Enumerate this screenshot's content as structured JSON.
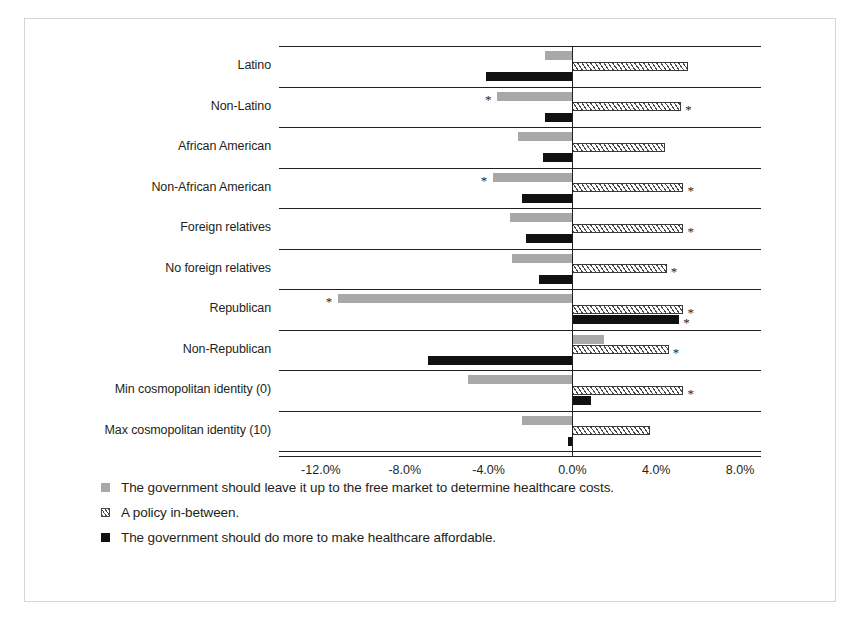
{
  "chart_data": {
    "type": "bar",
    "orientation": "horizontal",
    "title": "",
    "xlabel": "",
    "ylabel": "",
    "grid": true,
    "legend_position": "bottom-left",
    "xlim": [
      -14.0,
      9.0
    ],
    "xticks": [
      "-12.0%",
      "-8.0%",
      "-4.0%",
      "0.0%",
      "4.0%",
      "8.0%"
    ],
    "xtick_values": [
      -12.0,
      -8.0,
      -4.0,
      0.0,
      4.0,
      8.0
    ],
    "categories": [
      "Latino",
      "Non-Latino",
      "African American",
      "Non-African American",
      "Foreign relatives",
      "No foreign relatives",
      "Republican",
      "Non-Republican",
      "Min cosmopolitan identity (0)",
      "Max cosmopolitan identity (10)"
    ],
    "series": [
      {
        "name": "The government should leave it up to the free market to determine healthcare costs.",
        "key": "free_market",
        "color": "#a8a8a8",
        "pattern": "solid",
        "values": [
          -1.3,
          -3.6,
          -2.6,
          -3.8,
          -3.0,
          -2.9,
          -11.2,
          1.5,
          -5.0,
          -2.4
        ],
        "significant": [
          false,
          true,
          false,
          true,
          false,
          false,
          true,
          false,
          false,
          false
        ]
      },
      {
        "name": "A policy in-between.",
        "key": "in_between",
        "color": "#ffffff",
        "pattern": "hatched",
        "values": [
          5.5,
          5.2,
          4.4,
          5.3,
          5.3,
          4.5,
          5.3,
          4.6,
          5.3,
          3.7
        ],
        "significant": [
          false,
          true,
          false,
          true,
          true,
          true,
          true,
          true,
          true,
          false
        ]
      },
      {
        "name": "The government should do more to make healthcare affordable.",
        "key": "do_more",
        "color": "#111111",
        "pattern": "solid",
        "values": [
          -4.1,
          -1.3,
          -1.4,
          -2.4,
          -2.2,
          -1.6,
          5.1,
          -6.9,
          0.9,
          -0.2
        ],
        "significant": [
          false,
          false,
          false,
          false,
          false,
          false,
          true,
          false,
          false,
          false
        ]
      }
    ]
  },
  "legend": {
    "items": [
      {
        "swatch": "grey-square-swatch",
        "label": "The government should leave it up to the free market to determine healthcare costs."
      },
      {
        "swatch": "hatched-square-swatch",
        "label": "A policy in-between."
      },
      {
        "swatch": "black-square-swatch",
        "label": "The government should do more to make healthcare affordable."
      }
    ]
  },
  "marks": {
    "significance": "*"
  }
}
